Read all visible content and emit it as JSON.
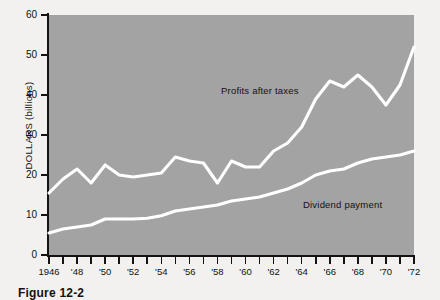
{
  "chart_data": {
    "type": "line",
    "title": "",
    "xlabel": "",
    "ylabel": "DOLLARS (billions)",
    "xlim": [
      1946,
      1972
    ],
    "ylim": [
      0,
      60
    ],
    "grid": false,
    "legend_position": "inline-annotation",
    "x": [
      1946,
      1947,
      1948,
      1949,
      1950,
      1951,
      1952,
      1953,
      1954,
      1955,
      1956,
      1957,
      1958,
      1959,
      1960,
      1961,
      1962,
      1963,
      1964,
      1965,
      1966,
      1967,
      1968,
      1969,
      1970,
      1971,
      1972
    ],
    "x_tick_labels": [
      "1946",
      "'48",
      "'50",
      "'52",
      "'54",
      "'56",
      "'58",
      "'60",
      "'62",
      "'64",
      "'66",
      "'68",
      "'70",
      "'72"
    ],
    "y_tick_labels": [
      "0",
      "10",
      "20",
      "30",
      "40",
      "50",
      "60"
    ],
    "y_ticks": [
      0,
      10,
      20,
      30,
      40,
      50,
      60
    ],
    "series": [
      {
        "name": "Profits after taxes",
        "color": "#ffffff",
        "values": [
          15.5,
          19.0,
          21.5,
          18.0,
          22.5,
          20.0,
          19.5,
          20.0,
          20.5,
          24.5,
          23.5,
          23.0,
          18.0,
          23.5,
          22.0,
          22.0,
          26.0,
          28.0,
          32.0,
          39.0,
          43.5,
          42.0,
          45.0,
          42.0,
          37.5,
          42.5,
          52.0
        ]
      },
      {
        "name": "Dividend payment",
        "color": "#ffffff",
        "values": [
          5.5,
          6.5,
          7.0,
          7.5,
          9.0,
          9.0,
          9.0,
          9.2,
          9.8,
          11.0,
          11.5,
          12.0,
          12.5,
          13.5,
          14.0,
          14.5,
          15.5,
          16.5,
          18.0,
          20.0,
          21.0,
          21.5,
          23.0,
          24.0,
          24.5,
          25.0,
          26.0
        ]
      }
    ],
    "annotations": [
      {
        "text": "Profits after taxes",
        "series": "Profits after taxes"
      },
      {
        "text": "Dividend payment",
        "series": "Dividend payment"
      }
    ]
  },
  "caption": {
    "text": "Figure 12-2"
  },
  "colors": {
    "plot_background": "#a3a3a3",
    "page_background": "#f2f1ef",
    "axis": "#15120f",
    "line": "#ffffff"
  }
}
